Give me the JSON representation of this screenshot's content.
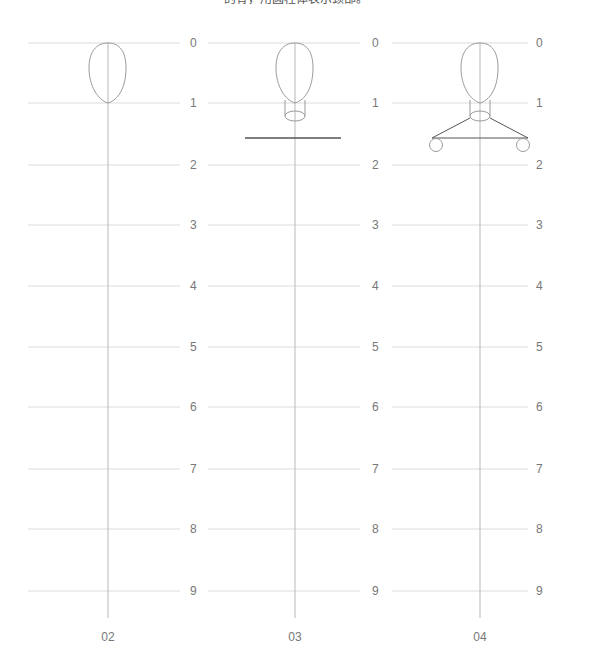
{
  "caption": "的骨，用圆柱体表示颈部。",
  "ticks": [
    "0",
    "1",
    "2",
    "3",
    "4",
    "5",
    "6",
    "7",
    "8",
    "9"
  ],
  "columns": [
    {
      "label": "02"
    },
    {
      "label": "03"
    },
    {
      "label": "04"
    }
  ],
  "colors": {
    "gridline": "#dcdcdc",
    "axis": "#b8b8b8",
    "outline": "#9a9a9a",
    "shoulder_line": "#555555",
    "text": "#777777"
  }
}
